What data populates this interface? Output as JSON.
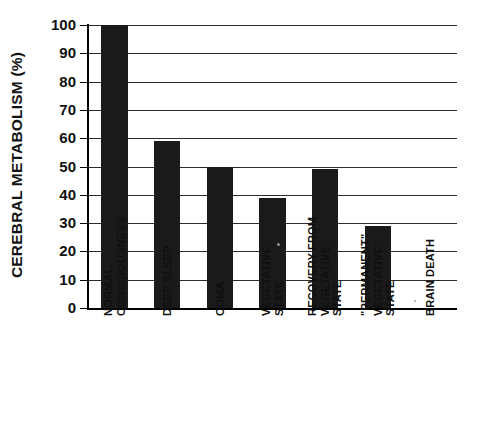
{
  "chart_data": {
    "type": "bar",
    "title": "",
    "xlabel": "",
    "ylabel": "CEREBRAL METABOLISM (%)",
    "ylim": [
      0,
      100
    ],
    "ytick_labels": [
      "100",
      "90",
      "80",
      "70",
      "60",
      "50",
      "40",
      "30",
      "20",
      "10",
      "0"
    ],
    "ytick_values": [
      100,
      90,
      80,
      70,
      60,
      50,
      40,
      30,
      20,
      10,
      0
    ],
    "grid": "horizontal",
    "legend": "none",
    "categories": [
      "NORMAL\nCONSCIOUSNESS",
      "DEEP SLEEP",
      "COMA",
      "VEGETATIVE\nSTATE",
      "RECOVERY FROM\nVEGETATIVE\nSTATE",
      "\"PERMANENT\"\nVEGETATIVE\nSTATE",
      "BRAIN DEATH"
    ],
    "values": [
      100,
      59,
      50,
      39,
      49,
      29,
      0
    ],
    "bar_color": "#1a1a1a"
  }
}
